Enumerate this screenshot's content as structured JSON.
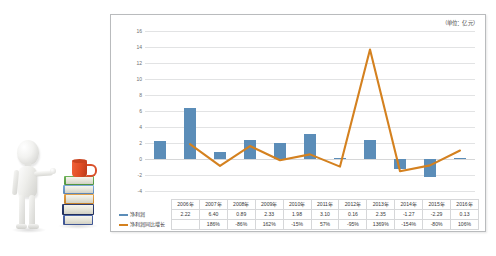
{
  "illustration": {
    "name": "3d-white-mannequin-pointing-at-book-stack",
    "figure_label": "white 3d mannequin figure",
    "books_label": "stack of books",
    "mug_label": "orange coffee mug"
  },
  "chart": {
    "unit_label": "（单位：亿元）"
  },
  "chart_data": {
    "type": "bar",
    "title": "",
    "subtitle": "",
    "xlabel": "",
    "ylabel": "",
    "unit_note": "（单位：亿元）",
    "grid": true,
    "legend_position": "table-left",
    "ylim": [
      -4,
      16
    ],
    "yticks": [
      16,
      14,
      12,
      10,
      8,
      6,
      4,
      2,
      0,
      -2,
      -4
    ],
    "ytick_labels": [
      "16",
      "14",
      "12",
      "10",
      "8",
      "6",
      "4",
      "2",
      "0",
      "-2",
      "-4"
    ],
    "categories": [
      "2006年",
      "2007年",
      "2008年",
      "2009年",
      "2010年",
      "2011年",
      "2012年",
      "2013年",
      "2014年",
      "2015年",
      "2016年"
    ],
    "series": [
      {
        "name": "净利润",
        "type": "bar",
        "color": "#5b8db8",
        "axis": "left",
        "values": [
          2.22,
          6.4,
          0.89,
          2.33,
          1.98,
          3.1,
          0.16,
          2.35,
          -1.27,
          -2.29,
          0.13
        ],
        "labels": [
          "2.22",
          "6.40",
          "0.89",
          "2.33",
          "1.98",
          "3.10",
          "0.16",
          "2.35",
          "-1.27",
          "-2.29",
          "0.13"
        ]
      },
      {
        "name": "净利润同比增长",
        "type": "line",
        "color": "#d4811f",
        "axis": "left-scaled",
        "values": [
          null,
          1.86,
          -0.86,
          1.62,
          -0.15,
          0.57,
          -0.95,
          13.69,
          -1.54,
          -0.8,
          1.06
        ],
        "labels": [
          "",
          "186%",
          "-86%",
          "162%",
          "-15%",
          "57%",
          "-95%",
          "1369%",
          "-154%",
          "-80%",
          "106%"
        ]
      }
    ],
    "table": {
      "header": [
        "",
        "2006年",
        "2007年",
        "2008年",
        "2009年",
        "2010年",
        "2011年",
        "2012年",
        "2013年",
        "2014年",
        "2015年",
        "2016年"
      ],
      "rows": [
        {
          "label": "净利润",
          "key_color": "#5b8db8",
          "cells": [
            "2.22",
            "6.40",
            "0.89",
            "2.33",
            "1.98",
            "3.10",
            "0.16",
            "2.35",
            "-1.27",
            "-2.29",
            "0.13"
          ]
        },
        {
          "label": "净利润同比增长",
          "key_color": "#d4811f",
          "cells": [
            "",
            "186%",
            "-86%",
            "162%",
            "-15%",
            "57%",
            "-95%",
            "1369%",
            "-154%",
            "-80%",
            "106%"
          ]
        }
      ]
    }
  }
}
